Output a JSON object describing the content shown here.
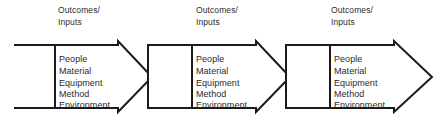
{
  "diagram": {
    "type": "process-flow",
    "colors": {
      "background": "#ffffff",
      "stroke": "#1a1a1a",
      "text": "#2b2b2b"
    },
    "headers": [
      {
        "line1": "Outcomes/",
        "line2": "Inputs"
      },
      {
        "line1": "Outcomes/",
        "line2": "Inputs"
      },
      {
        "line1": "Outcomes/",
        "line2": "Inputs"
      }
    ],
    "blocks": [
      {
        "name": "process-block-1",
        "items": [
          "People",
          "Material",
          "Equipment",
          "Method",
          "Environment"
        ]
      },
      {
        "name": "process-block-2",
        "items": [
          "People",
          "Material",
          "Equipment",
          "Method",
          "Environment"
        ]
      },
      {
        "name": "process-block-3",
        "items": [
          "People",
          "Material",
          "Equipment",
          "Method",
          "Environment"
        ]
      }
    ]
  }
}
